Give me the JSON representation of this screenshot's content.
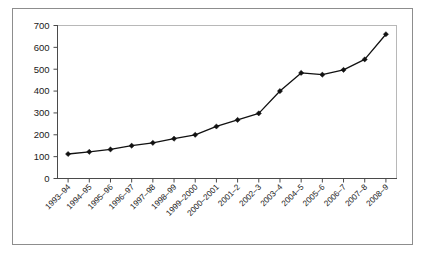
{
  "chart_data": {
    "type": "line",
    "title": "",
    "subtitle": "",
    "xlabel": "",
    "ylabel": "",
    "categories": [
      "1993–94",
      "1994–95",
      "1995–96",
      "1996–97",
      "1997–98",
      "1998–99",
      "1999–2000",
      "2000–2001",
      "2001–2",
      "2002–3",
      "2003–4",
      "2004–5",
      "2005–6",
      "2006–7",
      "2007–8",
      "2008–9"
    ],
    "values": [
      112,
      122,
      133,
      150,
      163,
      182,
      200,
      238,
      268,
      298,
      400,
      483,
      475,
      497,
      545,
      660
    ],
    "ylim": [
      0,
      700
    ],
    "yticks": [
      0,
      100,
      200,
      300,
      400,
      500,
      600,
      700
    ],
    "ytick_labels": [
      "0",
      "100",
      "200",
      "300",
      "400",
      "500",
      "600",
      "700"
    ],
    "grid": false,
    "legend": null,
    "legend_position": "none",
    "marker": "diamond",
    "line_color": "#111111",
    "marker_color": "#111111"
  },
  "frame": {
    "border_color": "#8d8d8d",
    "background": "#ffffff"
  }
}
